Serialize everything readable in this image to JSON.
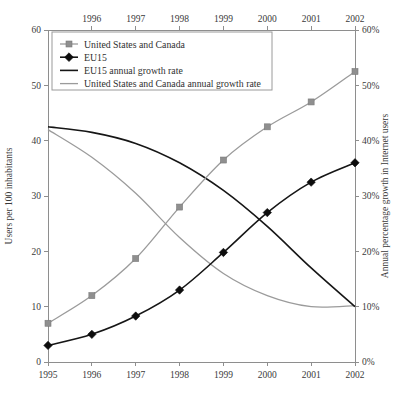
{
  "chart_data": {
    "type": "line",
    "title": "",
    "x": [
      1995,
      1996,
      1997,
      1998,
      1999,
      2000,
      2001,
      2002
    ],
    "x_tick_labels_bottom": [
      "1995",
      "1996",
      "1997",
      "1998",
      "1999",
      "2000",
      "2001",
      "2002"
    ],
    "x_tick_labels_top": [
      "1996",
      "1997",
      "1998",
      "1999",
      "2000",
      "2001",
      "2002"
    ],
    "xlim": [
      1995,
      2002
    ],
    "left_axis": {
      "label": "Users per 100 inhabitants",
      "ticks": [
        0,
        10,
        20,
        30,
        40,
        50,
        60
      ],
      "tick_labels": [
        "0",
        "10",
        "20",
        "30",
        "40",
        "50",
        "60"
      ],
      "ylim": [
        0,
        60
      ]
    },
    "right_axis": {
      "label": "Annual percentage growth in Internet users",
      "ticks": [
        0,
        10,
        20,
        30,
        40,
        50,
        60
      ],
      "tick_labels": [
        "0%",
        "10%",
        "20%",
        "30%",
        "40%",
        "50%",
        "60%"
      ],
      "ylim": [
        0,
        60
      ]
    },
    "grid": false,
    "legend_position": "top-left",
    "series": [
      {
        "name": "United States and Canada",
        "axis": "left",
        "marker": "square",
        "color": "#9b9b9b",
        "values": [
          7,
          12,
          18.7,
          28,
          36.5,
          42.5,
          47,
          52.5
        ]
      },
      {
        "name": "EU15",
        "axis": "left",
        "marker": "diamond",
        "color": "#161616",
        "values": [
          3,
          5,
          8.3,
          13,
          19.8,
          27,
          32.5,
          36
        ]
      },
      {
        "name": "EU15 annual growth rate",
        "axis": "right",
        "marker": "none",
        "color": "#161616",
        "values": [
          42.5,
          41.5,
          39.5,
          36,
          31,
          24.5,
          17,
          10
        ]
      },
      {
        "name": "United States and Canada annual growth rate",
        "axis": "right",
        "marker": "none",
        "color": "#9b9b9b",
        "values": [
          42,
          37,
          30.5,
          22.5,
          16,
          12,
          10,
          10.2
        ]
      }
    ]
  },
  "legend": {
    "items": [
      {
        "label": "United States and Canada",
        "style": "line-marker-square",
        "color": "#9b9b9b"
      },
      {
        "label": "EU15",
        "style": "line-marker-diamond",
        "color": "#161616"
      },
      {
        "label": "EU15 annual growth rate",
        "style": "line",
        "color": "#161616"
      },
      {
        "label": "United States and Canada annual growth rate",
        "style": "line",
        "color": "#9b9b9b"
      }
    ]
  }
}
